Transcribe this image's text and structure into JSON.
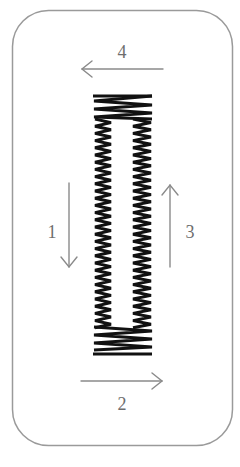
{
  "diagram": {
    "colors": {
      "frame": "#9a9a9a",
      "arrow": "#8a8a8a",
      "stitch": "#111111",
      "label": "#6e6e6e"
    },
    "steps": [
      {
        "number": "1",
        "direction": "down",
        "position": "left"
      },
      {
        "number": "2",
        "direction": "right",
        "position": "bottom"
      },
      {
        "number": "3",
        "direction": "up",
        "position": "right"
      },
      {
        "number": "4",
        "direction": "left",
        "position": "top"
      }
    ],
    "stitch_pattern": {
      "type": "zigzag-buttonhole",
      "top_bartack": true,
      "bottom_bartack": true,
      "columns": 2
    }
  }
}
